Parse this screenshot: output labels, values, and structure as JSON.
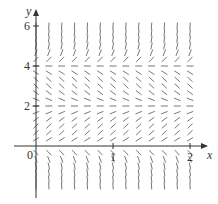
{
  "chart_data": {
    "type": "direction_field",
    "title": "",
    "xlabel": "x",
    "ylabel": "y",
    "xlim": [
      0,
      2.15
    ],
    "ylim": [
      -2,
      6.5
    ],
    "x_ticks": [
      0,
      1,
      2
    ],
    "x_tick_labels": [
      "0",
      "1",
      "2"
    ],
    "y_ticks": [
      2,
      4,
      6
    ],
    "y_tick_labels": [
      "2",
      "4",
      "6"
    ],
    "grid": false,
    "equilibria": [
      0,
      2,
      4
    ],
    "slope_sign_by_region": [
      {
        "range": "y < 0",
        "sign": "negative"
      },
      {
        "range": "0 < y < 2",
        "sign": "positive"
      },
      {
        "range": "2 < y < 4",
        "sign": "negative"
      },
      {
        "range": "y > 4",
        "sign": "positive"
      }
    ],
    "slope_function": "dy/dx proportional to y(y-2)(y-4)",
    "sample_x_step": 0.1667,
    "sample_x_range": [
      0,
      2
    ],
    "sample_y_step": 0.3333,
    "sample_y_range": [
      -2,
      6
    ],
    "segment_color": "#555555",
    "axis_color": "#333333"
  },
  "labels": {
    "x_axis": "x",
    "y_axis": "y",
    "origin": "0",
    "x1": "1",
    "x2": "2",
    "y2": "2",
    "y4": "4",
    "y6": "6"
  }
}
